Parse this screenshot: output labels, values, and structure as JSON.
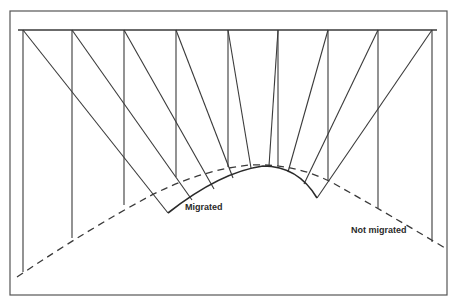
{
  "labels": {
    "migrated": "Migrated",
    "not_migrated": "Not migrated"
  },
  "colors": {
    "line": "#3a3a3a",
    "frame": "#555555",
    "background": "#ffffff"
  },
  "geometry": {
    "frame": {
      "x": 10,
      "y": 11,
      "w": 437,
      "h": 284
    },
    "surface_y": 30,
    "surface_x": [
      18,
      437
    ],
    "receivers_x": [
      23,
      72,
      124,
      176,
      228,
      278,
      328,
      378,
      432
    ],
    "not_migrated_y": [
      274,
      240,
      205,
      177,
      167,
      166,
      180,
      208,
      242
    ],
    "migrated_curve": {
      "start": [
        168,
        213
      ],
      "apex": [
        263,
        166
      ],
      "end": [
        317,
        198
      ]
    }
  }
}
